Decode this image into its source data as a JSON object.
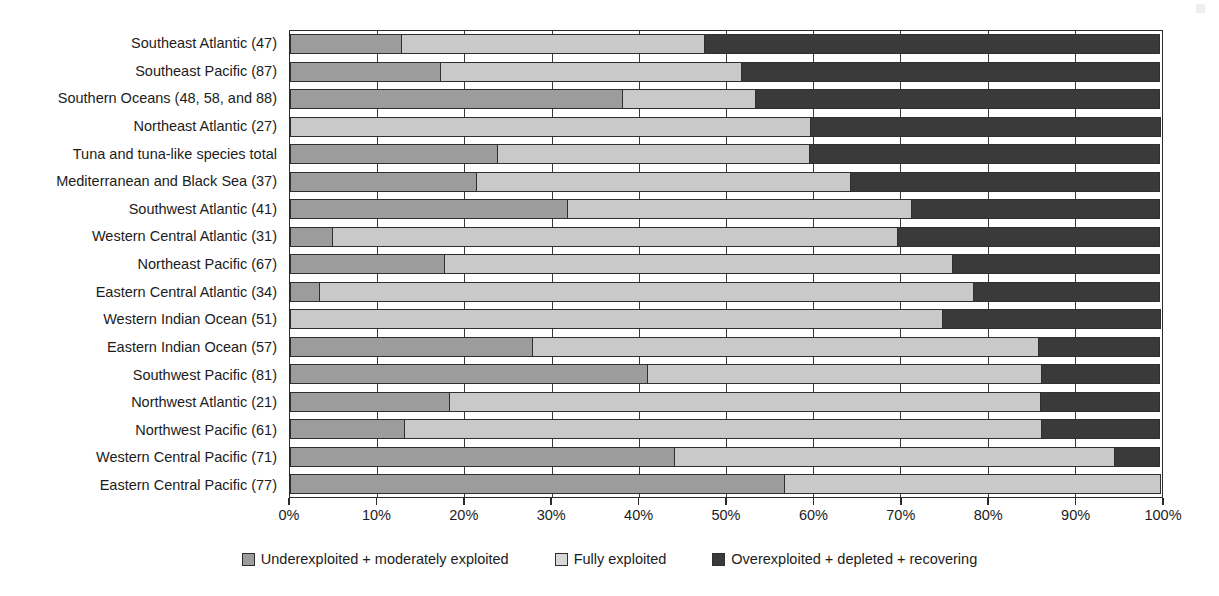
{
  "chart_data": {
    "type": "bar",
    "orientation": "horizontal",
    "stacked": true,
    "stack_unit": "percent",
    "title": "",
    "xlabel": "",
    "ylabel": "",
    "xlim": [
      0,
      100
    ],
    "grid": true,
    "legend_position": "bottom",
    "x_tick_labels": [
      "0%",
      "10%",
      "20%",
      "30%",
      "40%",
      "50%",
      "60%",
      "70%",
      "80%",
      "90%",
      "100%"
    ],
    "x_tick_values": [
      0,
      10,
      20,
      30,
      40,
      50,
      60,
      70,
      80,
      90,
      100
    ],
    "series": [
      {
        "name": "Underexploited + moderately exploited",
        "color": "#9c9c9c",
        "values": [
          12.9,
          17.3,
          38.2,
          0.0,
          23.8,
          21.5,
          31.9,
          4.9,
          17.8,
          3.4,
          0.0,
          27.9,
          41.0,
          18.4,
          13.2,
          44.2,
          56.8
        ]
      },
      {
        "name": "Fully exploited",
        "color": "#c9c9c9",
        "values": [
          34.8,
          34.6,
          15.3,
          59.7,
          36.0,
          43.0,
          39.5,
          64.9,
          58.4,
          75.1,
          74.9,
          58.1,
          45.4,
          67.8,
          73.1,
          50.5,
          43.2
        ]
      },
      {
        "name": "Overexploited + depleted + recovering",
        "color": "#3a3a3a",
        "values": [
          52.3,
          48.1,
          46.5,
          40.3,
          40.2,
          35.5,
          28.6,
          30.2,
          23.8,
          21.5,
          25.1,
          14.0,
          13.6,
          13.8,
          13.7,
          5.3,
          0.0
        ]
      }
    ],
    "categories": [
      "Southeast Atlantic (47)",
      "Southeast  Pacific (87)",
      "Southern Oceans (48, 58, and 88)",
      "Northeast Atlantic (27)",
      "Tuna and tuna-like species total",
      "Mediterranean and Black Sea (37)",
      "Southwest Atlantic (41)",
      "Western Central Atlantic (31)",
      "Northeast Pacific (67)",
      "Eastern Central Atlantic (34)",
      "Western Indian Ocean (51)",
      "Eastern Indian Ocean (57)",
      "Southwest Pacific (81)",
      "Northwest Atlantic (21)",
      "Northwest Pacific (61)",
      "Western Central Pacific (71)",
      "Eastern Central Pacific (77)"
    ]
  },
  "legend": {
    "items": [
      {
        "label": "Underexploited + moderately exploited",
        "swatch": "under"
      },
      {
        "label": "Fully exploited",
        "swatch": "fully"
      },
      {
        "label": "Overexploited + depleted + recovering",
        "swatch": "over"
      }
    ]
  },
  "colors": {
    "underexploited": "#9c9c9c",
    "fully_exploited": "#c9c9c9",
    "overexploited": "#3a3a3a",
    "axis": "#2b2b2b",
    "background": "#ffffff"
  }
}
